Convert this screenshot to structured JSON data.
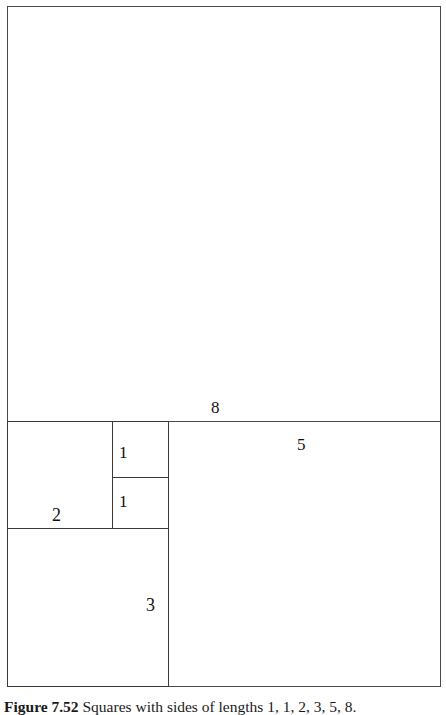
{
  "figure": {
    "caption": {
      "label": "Figure 7.52",
      "text": "Squares with sides of lengths 1, 1, 2, 3, 5, 8."
    },
    "stroke_color": "#3a3a3a",
    "background_color": "#ffffff",
    "squares": [
      {
        "name": "square-8",
        "label": "8",
        "side": 8
      },
      {
        "name": "square-5",
        "label": "5",
        "side": 5
      },
      {
        "name": "square-3",
        "label": "3",
        "side": 3
      },
      {
        "name": "square-2",
        "label": "2",
        "side": 2
      },
      {
        "name": "square-1-top",
        "label": "1",
        "side": 1
      },
      {
        "name": "square-1-bottom",
        "label": "1",
        "side": 1
      }
    ],
    "labels": {
      "eight": "8",
      "five": "5",
      "three": "3",
      "two": "2",
      "one_top": "1",
      "one_bottom": "1"
    }
  }
}
